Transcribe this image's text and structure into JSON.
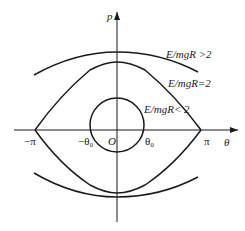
{
  "diagram": {
    "type": "phase-portrait",
    "axes": {
      "x_label": "θ",
      "y_label": "p",
      "origin_label": "O"
    },
    "tick_labels": {
      "neg_pi": "−π",
      "pos_pi": "π",
      "neg_theta0": "−θ₀",
      "pos_theta0": "θ₀"
    },
    "curves": [
      {
        "name": "open-orbit",
        "label": "E/mgR >2"
      },
      {
        "name": "separatrix",
        "label": "E/mgR=2"
      },
      {
        "name": "closed-orbit",
        "label": "E/mgR< 2"
      }
    ]
  }
}
